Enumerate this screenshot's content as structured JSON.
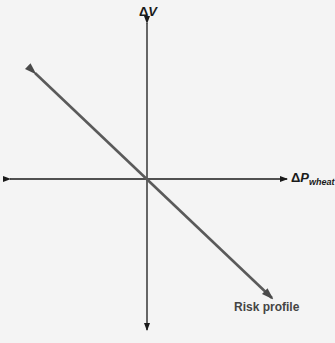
{
  "diagram": {
    "type": "risk-profile",
    "y_axis": {
      "delta": "Δ",
      "symbol": "V"
    },
    "x_axis": {
      "delta": "Δ",
      "symbol": "P",
      "subscript": "wheat"
    },
    "curve": {
      "label": "Risk profile",
      "slope": "negative",
      "color": "#5a5a5a"
    },
    "axis_color": "#1a1a1a",
    "background": "#f4f4f4"
  }
}
